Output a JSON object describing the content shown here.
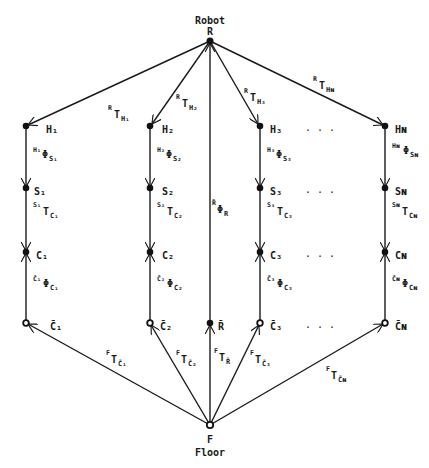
{
  "top_node": {
    "id": "R",
    "label": "R",
    "caption": "Robot"
  },
  "bottom_node": {
    "id": "F",
    "label": "F",
    "caption": "Floor"
  },
  "columns": [
    {
      "index": "1",
      "H": "H₁",
      "S": "S₁",
      "C": "C₁",
      "Cbar": "C̄₁",
      "RT": {
        "sup": "R",
        "base": "T",
        "sub": "H₁"
      },
      "HPhi": {
        "sup": "H₁",
        "base": "Φ",
        "sub": "S₁"
      },
      "ST": {
        "sup": "S₁",
        "base": "T",
        "sub": "C₁"
      },
      "CPhi": {
        "sup": "C̄₁",
        "base": "Φ",
        "sub": "C₁"
      },
      "FT": {
        "sup": "F",
        "base": "T",
        "sub": "C̄₁"
      }
    },
    {
      "index": "2",
      "H": "H₂",
      "S": "S₂",
      "C": "C₂",
      "Cbar": "C̄₂",
      "RT": {
        "sup": "R",
        "base": "T",
        "sub": "H₂"
      },
      "HPhi": {
        "sup": "H₂",
        "base": "Φ",
        "sub": "S₂"
      },
      "ST": {
        "sup": "S₂",
        "base": "T",
        "sub": "C₂"
      },
      "CPhi": {
        "sup": "C̄₂",
        "base": "Φ",
        "sub": "C₂"
      },
      "FT": {
        "sup": "F",
        "base": "T",
        "sub": "C̄₂"
      }
    },
    {
      "index": "3",
      "H": "H₃",
      "S": "S₃",
      "C": "C₃",
      "Cbar": "C̄₃",
      "RT": {
        "sup": "R",
        "base": "T",
        "sub": "H₃"
      },
      "HPhi": {
        "sup": "H₃",
        "base": "Φ",
        "sub": "S₃"
      },
      "ST": {
        "sup": "S₃",
        "base": "T",
        "sub": "C₃"
      },
      "CPhi": {
        "sup": "C̄₃",
        "base": "Φ",
        "sub": "C₃"
      },
      "FT": {
        "sup": "F",
        "base": "T",
        "sub": "C̄₃"
      }
    },
    {
      "index": "N",
      "H": "Hɴ",
      "S": "Sɴ",
      "C": "Cɴ",
      "Cbar": "C̄ɴ",
      "RT": {
        "sup": "R",
        "base": "T",
        "sub": "Hɴ"
      },
      "HPhi": {
        "sup": "Hɴ",
        "base": "Φ",
        "sub": "Sɴ"
      },
      "ST": {
        "sup": "Sɴ",
        "base": "T",
        "sub": "Cɴ"
      },
      "CPhi": {
        "sup": "C̄ɴ",
        "base": "Φ",
        "sub": "Cɴ"
      },
      "FT": {
        "sup": "F",
        "base": "T",
        "sub": "C̄ɴ"
      }
    }
  ],
  "center": {
    "Rbar": "R̄",
    "RPhi": {
      "sup": "R̄",
      "base": "Φ",
      "sub": "R"
    },
    "FT": {
      "sup": "F",
      "base": "T",
      "sub": "R̄"
    }
  },
  "ellipsis": ". . ."
}
